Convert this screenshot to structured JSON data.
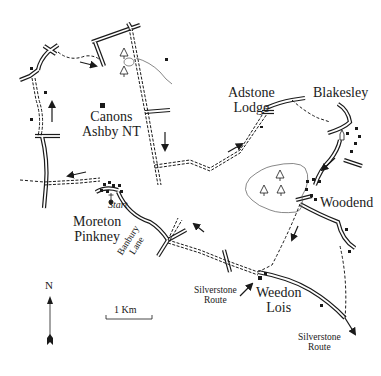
{
  "map": {
    "colors": {
      "ink": "#1a1a1a",
      "background": "#ffffff",
      "woodland": "#555555"
    },
    "places": [
      {
        "id": "canons_ashby",
        "line1": "Canons",
        "line2": "Ashby NT"
      },
      {
        "id": "adstone_lodge",
        "line1": "Adstone",
        "line2": "Lodge"
      },
      {
        "id": "blakesley",
        "line1": "Blakesley"
      },
      {
        "id": "woodend",
        "line1": "Woodend"
      },
      {
        "id": "moreton_pinkney",
        "line1": "Moreton",
        "line2": "Pinkney"
      },
      {
        "id": "weedon_lois",
        "line1": "Weedon",
        "line2": "Lois"
      }
    ],
    "start_label": "Start",
    "roads": [
      {
        "id": "banbury_lane",
        "line1": "Banbury",
        "line2": "Lane"
      }
    ],
    "routes": [
      {
        "id": "silverstone_route_west",
        "line1": "Silverstone",
        "line2": "Route"
      },
      {
        "id": "silverstone_route_south",
        "line1": "Silverstone",
        "line2": "Route"
      }
    ],
    "north_arrow": {
      "label": "N"
    },
    "scale_bar": {
      "label": "1 Km"
    },
    "icons": {
      "woodland": "tree-icon",
      "building": "square-icon",
      "church": "church-icon",
      "direction": "arrow-icon"
    }
  }
}
